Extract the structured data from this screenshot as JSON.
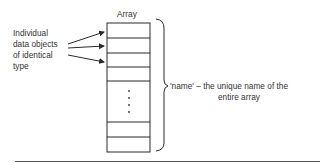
{
  "diagram": {
    "array_title": "Array",
    "left_label_lines": [
      "Individual",
      "data objects",
      "of identical",
      "type"
    ],
    "right_label_line1": "'name'  –  the unique name of the",
    "right_label_line2": "entire array",
    "array_rows_top": 4,
    "array_rows_bottom": 2,
    "ellipsis": "vertical-dots",
    "colors": {
      "line": "#2a2a2a",
      "text": "#333333",
      "background": "#ffffff"
    }
  }
}
